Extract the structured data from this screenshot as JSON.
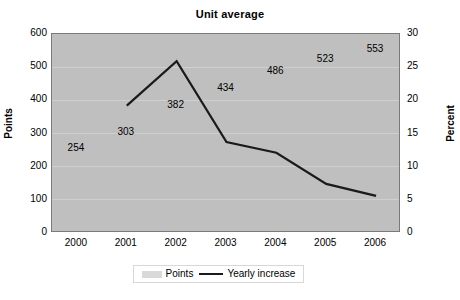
{
  "chart_data": {
    "type": "line",
    "title": "Unit average",
    "xlabel": "",
    "categories": [
      "2000",
      "2001",
      "2002",
      "2003",
      "2004",
      "2005",
      "2006"
    ],
    "series": [
      {
        "name": "Points",
        "axis": "left",
        "unit": "Points",
        "render": "data-labels-only",
        "values": [
          254,
          303,
          382,
          434,
          486,
          523,
          553
        ]
      },
      {
        "name": "Yearly increase",
        "axis": "right",
        "unit": "Percent",
        "render": "line",
        "values": [
          null,
          19.2,
          25.9,
          13.7,
          12.1,
          7.4,
          5.6
        ]
      }
    ],
    "left_axis": {
      "label": "Points",
      "ticks": [
        "0",
        "100",
        "200",
        "300",
        "400",
        "500",
        "600"
      ],
      "ylim": [
        0,
        600
      ]
    },
    "right_axis": {
      "label": "Percent",
      "ticks": [
        "0",
        "5",
        "10",
        "15",
        "20",
        "25",
        "30"
      ],
      "ylim": [
        0,
        30
      ]
    },
    "grid": true,
    "legend_position": "bottom",
    "colors": {
      "plot_background": "#bfbfbf",
      "gridline": "#cfcfcf",
      "line": "#1a1a1a",
      "points_swatch": "#d9d9d9",
      "text": "#000000"
    }
  },
  "legend": {
    "items": [
      {
        "label": "Points",
        "marker": "filled-rect-swatch"
      },
      {
        "label": "Yearly increase",
        "marker": "line-segment"
      }
    ]
  }
}
